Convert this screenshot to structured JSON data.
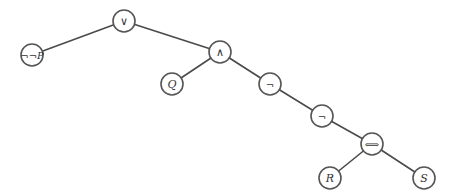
{
  "diagram": {
    "type": "parse-tree",
    "nodes": [
      {
        "id": "or",
        "label": "∨",
        "italic": false,
        "x": 124,
        "y": 21,
        "size": 11
      },
      {
        "id": "nnp",
        "label": "¬¬P",
        "italic": true,
        "x": 32,
        "y": 55,
        "size": 10
      },
      {
        "id": "and",
        "label": "∧",
        "italic": false,
        "x": 220,
        "y": 52,
        "size": 11
      },
      {
        "id": "q",
        "label": "Q",
        "italic": true,
        "x": 172,
        "y": 84,
        "size": 11
      },
      {
        "id": "not1",
        "label": "¬",
        "italic": false,
        "x": 270,
        "y": 84,
        "size": 10
      },
      {
        "id": "not2",
        "label": "¬",
        "italic": false,
        "x": 322,
        "y": 116,
        "size": 10
      },
      {
        "id": "iff",
        "label": "⟺",
        "italic": false,
        "x": 372,
        "y": 144,
        "size": 10
      },
      {
        "id": "r",
        "label": "R",
        "italic": true,
        "x": 330,
        "y": 178,
        "size": 11
      },
      {
        "id": "s",
        "label": "S",
        "italic": true,
        "x": 424,
        "y": 178,
        "size": 11
      }
    ],
    "edges": [
      {
        "from": "or",
        "to": "nnp"
      },
      {
        "from": "or",
        "to": "and"
      },
      {
        "from": "and",
        "to": "q"
      },
      {
        "from": "and",
        "to": "not1"
      },
      {
        "from": "not1",
        "to": "not2"
      },
      {
        "from": "not2",
        "to": "iff"
      },
      {
        "from": "iff",
        "to": "r"
      },
      {
        "from": "iff",
        "to": "s"
      }
    ],
    "node_radius": 11,
    "colors": {
      "stroke": "#555555",
      "edge": "#4a4a4a",
      "fill": "#ffffff",
      "text": "#333333"
    }
  }
}
